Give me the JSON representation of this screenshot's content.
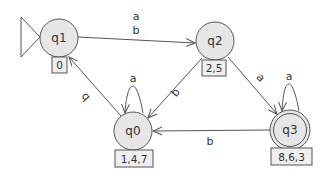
{
  "diagram": {
    "type": "finite-automaton",
    "colors": {
      "state_fill": "#e6e6e6",
      "stroke": "#555555",
      "text": "#333333",
      "box_fill": "#eeeeee"
    },
    "states": [
      {
        "id": "q1",
        "label": "q1",
        "box": "0",
        "initial": true,
        "accepting": false
      },
      {
        "id": "q2",
        "label": "q2",
        "box": "2,5",
        "initial": false,
        "accepting": false
      },
      {
        "id": "q0",
        "label": "q0",
        "box": "1,4,7",
        "initial": false,
        "accepting": false
      },
      {
        "id": "q3",
        "label": "q3",
        "box": "8,6,3",
        "initial": false,
        "accepting": true
      }
    ],
    "transitions": [
      {
        "from": "q1",
        "to": "q2",
        "labels": [
          "a",
          "b"
        ]
      },
      {
        "from": "q2",
        "to": "q0",
        "label": "b"
      },
      {
        "from": "q2",
        "to": "q3",
        "label": "a"
      },
      {
        "from": "q0",
        "to": "q1",
        "label": "b"
      },
      {
        "from": "q0",
        "to": "q0",
        "label": "a"
      },
      {
        "from": "q3",
        "to": "q3",
        "label": "a"
      },
      {
        "from": "q3",
        "to": "q0",
        "label": "b"
      }
    ],
    "edge_labels": {
      "q1_q2_a": "a",
      "q1_q2_b": "b",
      "q2_q0": "b",
      "q2_q3": "a",
      "q0_q1": "b",
      "q0_loop": "a",
      "q3_loop": "a",
      "q3_q0": "b"
    }
  }
}
